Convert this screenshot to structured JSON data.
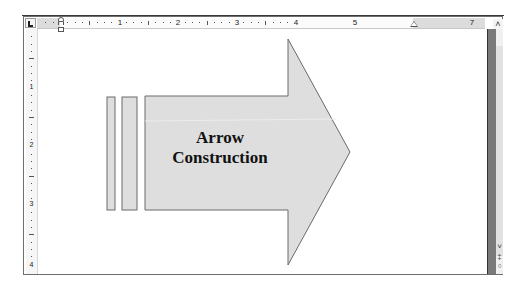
{
  "app": {
    "view": "Print Layout",
    "document_content": {
      "shape_type": "block arrow with stripes",
      "arrow_text_line1": "Arrow",
      "arrow_text_line2": "Construction",
      "fill_color": "#dedede",
      "outline_color": "#6a6a6a"
    }
  },
  "horizontal_ruler": {
    "numbers": [
      "1",
      "2",
      "3",
      "4",
      "5",
      "7"
    ],
    "positions": [
      120,
      178,
      237,
      296,
      355,
      472
    ]
  },
  "vertical_ruler": {
    "numbers": [
      "1",
      "2",
      "3",
      "4"
    ],
    "positions": [
      87,
      145,
      204,
      265
    ]
  },
  "controls": {
    "tab_selector": "left-tab",
    "scroll_up_glyph": "˄",
    "scroll_down_glyph": "˅",
    "prev_page_glyph": "‡",
    "browse_object_glyph": "○"
  }
}
